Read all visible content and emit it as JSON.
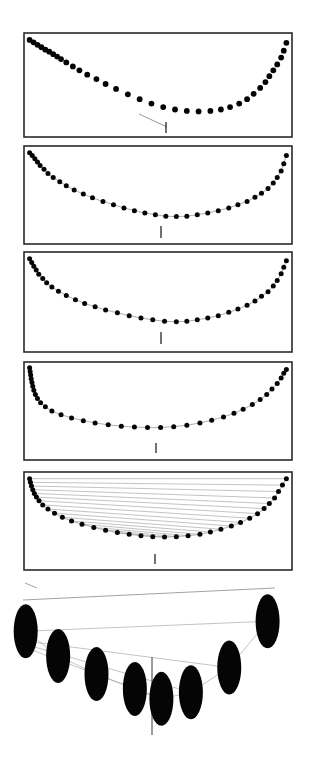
{
  "figure": {
    "canvas": {
      "width": 311,
      "height": 775,
      "background": "#ffffff"
    },
    "style": {
      "dot_color": "#050505",
      "frame_color": "#2a2a2a",
      "connector_color": "#8d8d8d",
      "chord_color": "#9a9a9a",
      "marker_color": "#111111"
    },
    "panel_labels": [
      "panel-1-initial-probe",
      "panel-2-converged-symmetric",
      "panel-3-converged-deeper",
      "panel-4-asymmetric-steep-left",
      "panel-5-horizontal-chords",
      "panel-6-magnified-detail"
    ]
  },
  "chart_data": [
    {
      "id": "panel-1",
      "type": "scatter",
      "title": "",
      "xlabel": "",
      "ylabel": "",
      "xlim": [
        0,
        100
      ],
      "ylim": [
        0,
        100
      ],
      "grid": false,
      "legend": null,
      "frame": {
        "x": 24,
        "y": 33,
        "width": 268,
        "height": 104
      },
      "series": [
        {
          "name": "sampled-points",
          "marker": "filled-circle",
          "x": [
            1,
            2.5,
            4,
            5.5,
            7,
            8.5,
            10,
            11.5,
            13,
            15,
            17.5,
            20,
            23,
            26.5,
            30,
            34,
            38.5,
            43,
            47.5,
            52,
            56.5,
            61,
            65.5,
            70,
            74,
            77.5,
            81,
            84,
            86.5,
            89,
            91,
            92.5,
            94,
            95.5,
            97,
            98,
            99
          ],
          "y": [
            96,
            93.5,
            91,
            88.5,
            86,
            84,
            81.5,
            79,
            76.5,
            73,
            69,
            65,
            60.5,
            56,
            51,
            46,
            40.5,
            35.5,
            31,
            27.5,
            25,
            23.5,
            23,
            23.5,
            25,
            27.5,
            31,
            35.5,
            41,
            47,
            53,
            59,
            65,
            71,
            78,
            85,
            93
          ]
        }
      ],
      "annotations": [
        {
          "name": "probe-segment",
          "type": "line",
          "from": [
            43,
            35.5
          ],
          "to": [
            52,
            27.5
          ]
        },
        {
          "name": "minimum-marker",
          "type": "vertical-tick",
          "at": [
            52,
            27.5
          ]
        }
      ]
    },
    {
      "id": "panel-2",
      "type": "scatter",
      "title": "",
      "xlabel": "",
      "ylabel": "",
      "xlim": [
        0,
        100
      ],
      "ylim": [
        0,
        100
      ],
      "grid": false,
      "legend": null,
      "frame": {
        "x": 24,
        "y": 146,
        "width": 268,
        "height": 98
      },
      "series": [
        {
          "name": "sampled-points",
          "marker": "filled-circle",
          "connector": "thin-gray-line",
          "x": [
            1,
            2,
            3,
            4,
            5,
            6.5,
            8,
            10,
            12.5,
            15,
            18,
            21.5,
            25,
            29,
            33,
            37,
            41,
            45,
            49,
            53,
            57,
            61,
            65,
            69,
            73,
            77,
            80.5,
            84,
            87,
            89.5,
            92,
            94,
            95.5,
            97,
            98,
            99
          ],
          "y": [
            96,
            93,
            89.5,
            86,
            82,
            78,
            73.5,
            69,
            64.5,
            60,
            55.5,
            51,
            47,
            43,
            39.5,
            36,
            33,
            30.5,
            28.5,
            27,
            26.5,
            27,
            28.5,
            30.5,
            33,
            36,
            39.5,
            43,
            47.5,
            52,
            57,
            63,
            69,
            76,
            84,
            93
          ]
        }
      ],
      "annotations": [
        {
          "name": "minimum-marker",
          "type": "vertical-tick",
          "at": [
            55,
            26.5
          ]
        }
      ]
    },
    {
      "id": "panel-3",
      "type": "scatter",
      "title": "",
      "xlabel": "",
      "ylabel": "",
      "xlim": [
        0,
        100
      ],
      "ylim": [
        0,
        100
      ],
      "grid": false,
      "legend": null,
      "frame": {
        "x": 24,
        "y": 252,
        "width": 268,
        "height": 100
      },
      "series": [
        {
          "name": "sampled-points",
          "marker": "filled-circle",
          "connector": "thin-gray-line",
          "x": [
            1,
            1.8,
            2.6,
            3.5,
            4.5,
            6,
            7.5,
            9.5,
            12,
            15,
            18.5,
            22,
            26,
            30,
            34.5,
            39,
            43.5,
            48,
            52.5,
            57,
            61,
            65,
            69,
            73,
            77,
            80.5,
            84,
            87,
            89.5,
            92,
            94,
            95.5,
            97,
            98,
            99
          ],
          "y": [
            96,
            92,
            88,
            84,
            79.5,
            75,
            70.5,
            66,
            61.5,
            57,
            52.5,
            48.5,
            45,
            41.5,
            38.5,
            35.5,
            33,
            31,
            29.5,
            29,
            29.5,
            31,
            33,
            35.5,
            39,
            42.5,
            46.5,
            51,
            56,
            61,
            67,
            73,
            80,
            87,
            94
          ]
        }
      ],
      "annotations": [
        {
          "name": "minimum-marker",
          "type": "vertical-tick",
          "at": [
            55,
            29
          ]
        }
      ]
    },
    {
      "id": "panel-4",
      "type": "scatter",
      "title": "",
      "xlabel": "",
      "ylabel": "",
      "xlim": [
        0,
        100
      ],
      "ylim": [
        0,
        100
      ],
      "grid": false,
      "legend": null,
      "frame": {
        "x": 24,
        "y": 362,
        "width": 268,
        "height": 98
      },
      "series": [
        {
          "name": "sampled-points",
          "marker": "filled-circle",
          "connector": "thin-gray-line",
          "x": [
            1,
            1.2,
            1.4,
            1.6,
            1.9,
            2.2,
            2.6,
            3.2,
            4,
            5.2,
            7,
            9.5,
            13,
            17,
            21.5,
            26,
            31,
            36,
            41,
            46,
            51,
            56,
            61,
            66,
            70.5,
            75,
            79,
            82.5,
            86,
            89,
            91.5,
            93.5,
            95.5,
            97,
            98,
            99
          ],
          "y": [
            97,
            93,
            89,
            85,
            81,
            77,
            72.5,
            68,
            63.5,
            59,
            54.5,
            50,
            46,
            42.5,
            39.5,
            37,
            35,
            33.5,
            32.5,
            32,
            32,
            33,
            34.5,
            37,
            40,
            43.5,
            47.5,
            52,
            57,
            62.5,
            68,
            74,
            80,
            86,
            91,
            95
          ]
        }
      ],
      "annotations": [
        {
          "name": "minimum-marker",
          "type": "vertical-tick",
          "at": [
            52,
            32
          ]
        }
      ]
    },
    {
      "id": "panel-5",
      "type": "scatter",
      "title": "",
      "xlabel": "",
      "ylabel": "",
      "xlim": [
        0,
        100
      ],
      "ylim": [
        0,
        100
      ],
      "grid": false,
      "legend": null,
      "frame": {
        "x": 24,
        "y": 472,
        "width": 268,
        "height": 98
      },
      "series": [
        {
          "name": "sampled-points",
          "marker": "filled-circle",
          "connector": "thin-gray-line",
          "x": [
            1,
            1.3,
            1.7,
            2.2,
            2.8,
            3.6,
            4.6,
            6,
            8,
            10.5,
            13.5,
            17,
            21,
            25.5,
            30,
            34.5,
            39,
            43.5,
            48,
            52.5,
            57,
            61.5,
            66,
            70,
            74,
            78,
            81.5,
            85,
            88,
            90.5,
            92.5,
            94.5,
            96,
            97.5,
            99
          ],
          "y": [
            96,
            92,
            88,
            84,
            80,
            76,
            72,
            67.5,
            63,
            58.5,
            54,
            50,
            46.5,
            43,
            40,
            37.5,
            35.5,
            34,
            33,
            32.5,
            33,
            34,
            35.5,
            38,
            41,
            44.5,
            48.5,
            53,
            58,
            63.5,
            69,
            75,
            82,
            89,
            96
          ]
        }
      ],
      "annotations": [
        {
          "name": "minimum-marker",
          "type": "vertical-tick",
          "at": [
            50,
            32.5
          ]
        },
        {
          "name": "horizontal-chords",
          "type": "chord-set",
          "count": 17,
          "description": "each left-branch point joined horizontally to its mirrored right-branch point"
        }
      ]
    },
    {
      "id": "panel-6",
      "type": "scatter",
      "title": "",
      "xlabel": "",
      "ylabel": "",
      "xlim": [
        0,
        100
      ],
      "ylim": [
        0,
        100
      ],
      "grid": false,
      "legend": null,
      "frame": null,
      "magnified": true,
      "series": [
        {
          "name": "magnified-points",
          "marker": "filled-ellipse",
          "x": [
            6,
            17,
            30,
            43,
            52,
            62,
            75,
            88
          ],
          "y": [
            72,
            57,
            46,
            37,
            31,
            35,
            50,
            78
          ]
        }
      ],
      "annotations": [
        {
          "name": "chord-a",
          "type": "line",
          "from": [
            6,
            72
          ],
          "to": [
            88,
            78
          ]
        },
        {
          "name": "chord-b",
          "type": "line",
          "from": [
            6,
            66
          ],
          "to": [
            75,
            50
          ]
        },
        {
          "name": "chord-c",
          "type": "line",
          "from": [
            6,
            64
          ],
          "to": [
            62,
            35
          ]
        },
        {
          "name": "chord-d",
          "type": "line",
          "from": [
            6,
            62
          ],
          "to": [
            52,
            31
          ]
        },
        {
          "name": "curve-path",
          "type": "polyline",
          "points": [
            [
              6,
              72
            ],
            [
              17,
              57
            ],
            [
              30,
              46
            ],
            [
              43,
              37
            ],
            [
              52,
              31
            ],
            [
              62,
              35
            ],
            [
              75,
              50
            ],
            [
              88,
              78
            ]
          ]
        },
        {
          "name": "vertical-axis-marker",
          "type": "vertical-line",
          "at_x": 47
        },
        {
          "name": "stray-long-line",
          "type": "line",
          "from": [
            2,
            6
          ],
          "to": [
            96,
            22
          ]
        },
        {
          "name": "stray-dash",
          "type": "line",
          "from": [
            2,
            32
          ],
          "to": [
            8,
            36
          ]
        }
      ]
    }
  ]
}
